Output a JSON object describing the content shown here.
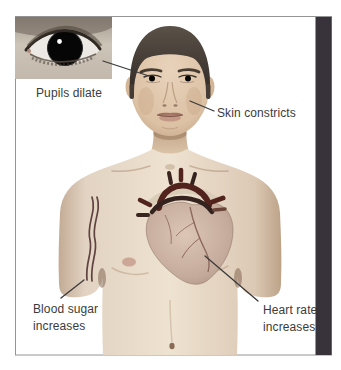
{
  "diagram": {
    "labels": {
      "pupils": "Pupils dilate",
      "skin": "Skin constricts",
      "blood_sugar": "Blood sugar\nincreases",
      "heart_rate": "Heart rate\nincreases"
    },
    "colors": {
      "background": "#ffffff",
      "frame_border": "#949494",
      "accent_bar": "#38323a",
      "label_text": "#3b3b3b",
      "leader_line": "#3a3a3a",
      "skin_light": "#ecdfcd",
      "skin_shadow": "#c0a78f",
      "hair": "#48403a",
      "pupil": "#060606",
      "heart_body": "#c9b2a4",
      "heart_vessel_dark": "#52231d",
      "heart_vessel_black": "#33221e",
      "arm_vessel": "#5f4340",
      "nipple": "#c79c8d"
    },
    "illustrations": {
      "eye_inset": "dilated-pupil-eye-photo",
      "figure": "male-torso-front",
      "heart": "anatomical-heart"
    }
  }
}
